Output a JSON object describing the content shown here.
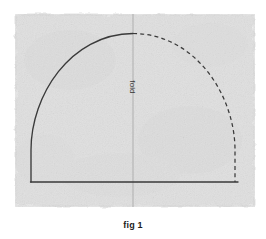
{
  "figure": {
    "caption": "fig 1",
    "fold_label": "fold",
    "paper": {
      "fill_color": "#e2e2e2",
      "edge_style": "deckled",
      "left": 15,
      "top": 14,
      "right": 255,
      "bottom": 207
    },
    "fold_line": {
      "color": "#b4b4b4",
      "x": 133,
      "top": 14,
      "bottom": 207,
      "orientation": "vertical"
    },
    "pattern": {
      "stroke_color": "#3a3a3a",
      "solid_side": "left",
      "dashed_side": "right",
      "apex_x": 133,
      "apex_y": 33,
      "baseline_y": 182,
      "left_x": 31,
      "right_x": 238,
      "shoulder_y": 150,
      "description": "dome-shaped pattern piece, half drawn solid on the fold, mirrored half dashed"
    }
  }
}
